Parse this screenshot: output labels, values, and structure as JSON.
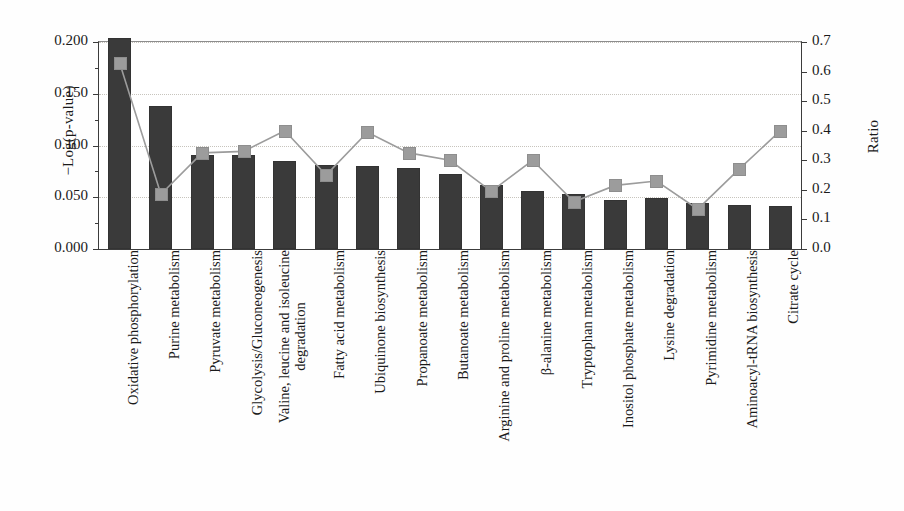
{
  "chart_data": {
    "type": "bar",
    "title": "",
    "xlabel": "",
    "ylabel": "−Log(p-value)",
    "y2label": "Ratio",
    "ylim": [
      0.0,
      0.2
    ],
    "y2lim": [
      0.0,
      0.7
    ],
    "grid": true,
    "legend_position": "none",
    "y_ticklabels": [
      "0.000",
      "0.050",
      "0.100",
      "0.150",
      "0.200"
    ],
    "y_tickvalues": [
      0.0,
      0.05,
      0.1,
      0.15,
      0.2
    ],
    "y2_ticklabels": [
      "0.0",
      "0.1",
      "0.2",
      "0.3",
      "0.4",
      "0.5",
      "0.6",
      "0.7"
    ],
    "y2_tickvalues": [
      0.0,
      0.1,
      0.2,
      0.3,
      0.4,
      0.5,
      0.6,
      0.7
    ],
    "categories": [
      "Oxidative phosphorylation",
      "Purine metabolism",
      "Pyruvate metabolism",
      "Glycolysis/Gluconeogenesis",
      "Valine, leucine and isoleucine degradation",
      "Fatty acid metabolism",
      "Ubiquinone biosynthesis",
      "Propanoate metabolism",
      "Butanoate metabolism",
      "Arginine and proline metabolism",
      "β-alanine metabolism",
      "Tryptophan metabolism",
      "Inositol phosphate metabolism",
      "Lysine degradation",
      "Pyrimidine metabolism",
      "Aminoacyl-tRNA biosynthesis",
      "Citrate cycle"
    ],
    "categories_lines": [
      [
        "Oxidative phosphorylation"
      ],
      [
        "Purine metabolism"
      ],
      [
        "Pyruvate metabolism"
      ],
      [
        "Glycolysis/Gluconeogenesis"
      ],
      [
        "Valine, leucine and isoleucine",
        "degradation"
      ],
      [
        "Fatty acid metabolism"
      ],
      [
        "Ubiquinone biosynthesis"
      ],
      [
        "Propanoate metabolism"
      ],
      [
        "Butanoate metabolism"
      ],
      [
        "Arginine and proline metabolism"
      ],
      [
        "β-alanine metabolism"
      ],
      [
        "Tryptophan metabolism"
      ],
      [
        "Inositol phosphate metabolism"
      ],
      [
        "Lysine degradation"
      ],
      [
        "Pyrimidine metabolism"
      ],
      [
        "Aminoacyl-tRNA biosynthesis"
      ],
      [
        "Citrate cycle"
      ]
    ],
    "series": [
      {
        "name": "−Log(p-value)",
        "type": "bar",
        "axis": "left",
        "color": "#3a3a3a",
        "values": [
          0.204,
          0.138,
          0.091,
          0.091,
          0.085,
          0.081,
          0.08,
          0.078,
          0.072,
          0.062,
          0.056,
          0.053,
          0.047,
          0.049,
          0.044,
          0.043,
          0.042
        ]
      },
      {
        "name": "Ratio",
        "type": "line",
        "axis": "right",
        "color": "#9c9c9c",
        "values": [
          0.63,
          0.185,
          0.325,
          0.33,
          0.4,
          0.25,
          0.395,
          0.325,
          0.3,
          0.195,
          0.3,
          0.16,
          0.215,
          0.23,
          0.135,
          0.27,
          0.4
        ]
      }
    ]
  }
}
